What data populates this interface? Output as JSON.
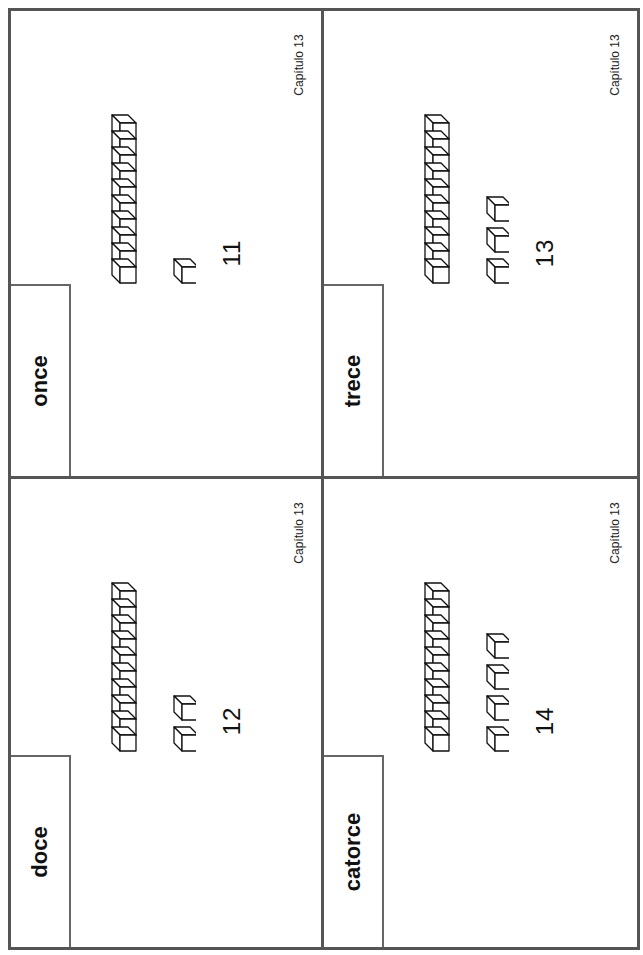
{
  "document": {
    "title": "Spanish number word cards 11–14",
    "cards": [
      {
        "word": "once",
        "numeral": "11",
        "tens": 1,
        "ones": 1,
        "chapter": "Capítulo 13"
      },
      {
        "word": "trece",
        "numeral": "13",
        "tens": 1,
        "ones": 3,
        "chapter": "Capítulo 13"
      },
      {
        "word": "doce",
        "numeral": "12",
        "tens": 1,
        "ones": 2,
        "chapter": "Capítulo 13"
      },
      {
        "word": "catorce",
        "numeral": "14",
        "tens": 1,
        "ones": 4,
        "chapter": "Capítulo 13"
      }
    ]
  },
  "colors": {
    "border": "#555555",
    "ink": "#111111",
    "paper": "#ffffff"
  }
}
